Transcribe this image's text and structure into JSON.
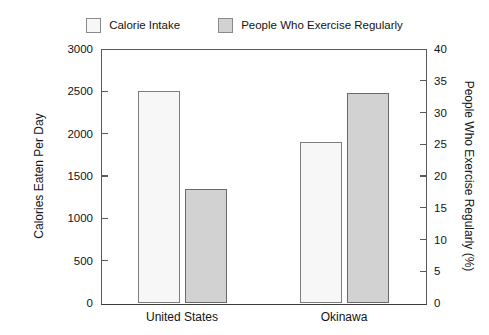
{
  "legend": {
    "position": "top-center",
    "entries": [
      {
        "label": "Calorie Intake",
        "swatch": "legend-swatch-calorie-intake",
        "color": "#f7f7f7"
      },
      {
        "label": "People Who Exercise Regularly",
        "swatch": "legend-swatch-exercise",
        "color": "#d2d2d2"
      }
    ]
  },
  "chart_data": {
    "type": "bar",
    "title": "",
    "subtitle": "",
    "xlabel": "",
    "ylabel": "Calories Eaten Per Day",
    "y2label": "People Who Exercise Regularly (%)",
    "categories": [
      "United States",
      "Okinawa"
    ],
    "series": [
      {
        "name": "Calorie Intake",
        "axis": "left",
        "color": "#f7f7f7",
        "edge_color": "#7d7d7d",
        "values": [
          2500,
          1900
        ]
      },
      {
        "name": "People Who Exercise Regularly",
        "axis": "right",
        "color": "#d2d2d2",
        "edge_color": "#6a6a6a",
        "values": [
          18,
          33
        ]
      }
    ],
    "ylim": [
      0,
      3000
    ],
    "yticks": [
      0,
      500,
      1000,
      1500,
      2000,
      2500,
      3000
    ],
    "y2lim": [
      0,
      40
    ],
    "y2ticks": [
      0,
      5,
      10,
      15,
      20,
      25,
      30,
      35,
      40
    ],
    "grid": false,
    "legend_position": "top"
  },
  "axes": {
    "left_ticks": [
      "0",
      "500",
      "1000",
      "1500",
      "2000",
      "2500",
      "3000"
    ],
    "right_ticks": [
      "0",
      "5",
      "10",
      "15",
      "20",
      "25",
      "30",
      "35",
      "40"
    ],
    "left_title": "Calories Eaten Per Day",
    "right_title": "People Who Exercise Regularly (%)"
  },
  "colors": {
    "background": "#ffffff",
    "axis_line": "#5a5a5a",
    "baseline": "#3c3c3c",
    "text": "#131313",
    "series_light": "#f7f7f7",
    "series_dark": "#d2d2d2"
  }
}
